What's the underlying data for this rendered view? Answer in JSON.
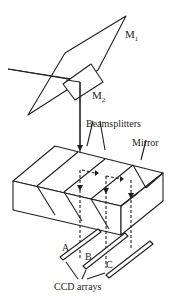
{
  "diagram": {
    "labels": {
      "m1": "M",
      "m1_sub": "1",
      "m2": "M",
      "m2_sub": "2",
      "beamsplitters": "Beamsplitters",
      "mirror": "Mirror",
      "ccd_a": "A",
      "ccd_b": "B",
      "ccd_c": "C",
      "ccd_arrays": "CCD arrays"
    },
    "colors": {
      "stroke": "#231f20",
      "background": "#ffffff"
    }
  }
}
